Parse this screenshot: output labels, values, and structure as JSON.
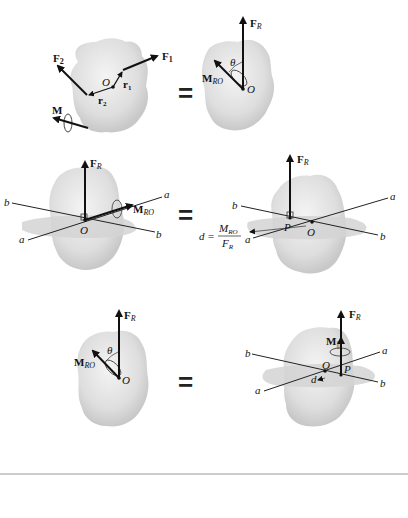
{
  "diagram": {
    "equals_sign": "=",
    "panel1": {
      "forces": [
        "F",
        "F"
      ],
      "force_subscripts": [
        "1",
        "2"
      ],
      "position_vectors": [
        "r",
        "r"
      ],
      "position_subscripts": [
        "1",
        "2"
      ],
      "origin": "O",
      "moment": "M"
    },
    "panel2": {
      "resultant_force": "F",
      "resultant_subscript": "R",
      "moment": "M",
      "moment_subscript": "RO",
      "angle": "θ",
      "origin": "O"
    },
    "panel3": {
      "resultant_force": "F",
      "resultant_subscript": "R",
      "moment": "M",
      "moment_subscript": "RO",
      "origin": "O",
      "axis_a": "a",
      "axis_b": "b"
    },
    "panel4": {
      "resultant_force": "F",
      "resultant_subscript": "R",
      "point": "P",
      "origin": "O",
      "axis_a": "a",
      "axis_b": "b",
      "distance_formula_lhs": "d =",
      "numerator": "M",
      "numerator_subscript": "RO",
      "denominator": "F",
      "denominator_subscript": "R"
    },
    "panel5": {
      "resultant_force": "F",
      "resultant_subscript": "R",
      "moment": "M",
      "moment_subscript": "RO",
      "angle": "θ",
      "origin": "O"
    },
    "panel6": {
      "resultant_force": "F",
      "resultant_subscript": "R",
      "parallel_moment": "M",
      "parallel_symbol": "||",
      "point": "P",
      "origin": "O",
      "distance": "d",
      "axis_a": "a",
      "axis_b": "b"
    }
  }
}
